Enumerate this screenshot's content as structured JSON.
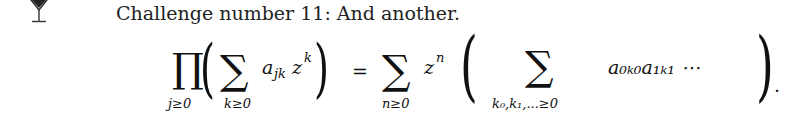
{
  "icon": {
    "name": "cocktail-glass-icon"
  },
  "heading": {
    "text": "Challenge number 11:  And another."
  },
  "equation": {
    "product_symbol": "∏",
    "product_index": "j≥0",
    "lparen1": "(",
    "sum1_symbol": "∑",
    "sum1_index": "k≥0",
    "term1": "a",
    "term1_sub": "jk",
    "term1_z": "z",
    "term1_sup": "k",
    "rparen1": ")",
    "equals": "=",
    "sum2_symbol": "∑",
    "sum2_index": "n≥0",
    "term2_z": "z",
    "term2_sup": "n",
    "lparen2": "(",
    "sum3_symbol": "∑",
    "sum3_index": "k₀,k₁,...≥0",
    "term3": "a₀ₖ₀a₁ₖ₁ ⋯",
    "rparen2": ")",
    "period": "."
  }
}
